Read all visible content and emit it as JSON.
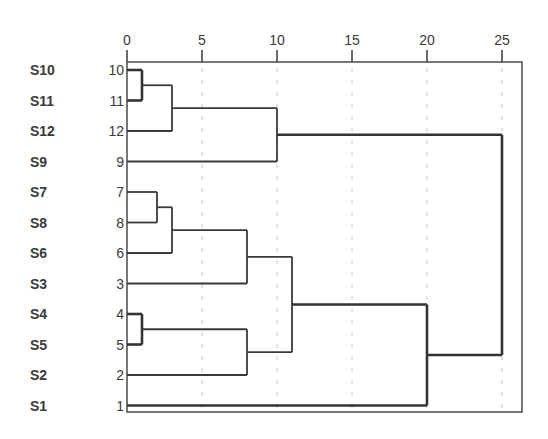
{
  "chart_data": {
    "type": "dendrogram",
    "title": "",
    "xlabel": "",
    "ylabel": "",
    "xlim": [
      0,
      26.3
    ],
    "x_ticks": [
      0,
      5,
      10,
      15,
      20,
      25
    ],
    "x_tick_labels": [
      "0",
      "5",
      "10",
      "15",
      "20",
      "25"
    ],
    "grid": "vertical dashed at ticks",
    "axis_position": "top",
    "leaves": [
      {
        "sample": "S10",
        "index": "10"
      },
      {
        "sample": "S11",
        "index": "11"
      },
      {
        "sample": "S12",
        "index": "12"
      },
      {
        "sample": "S9",
        "index": "9"
      },
      {
        "sample": "S7",
        "index": "7"
      },
      {
        "sample": "S8",
        "index": "8"
      },
      {
        "sample": "S6",
        "index": "6"
      },
      {
        "sample": "S3",
        "index": "3"
      },
      {
        "sample": "S4",
        "index": "4"
      },
      {
        "sample": "S5",
        "index": "5"
      },
      {
        "sample": "S2",
        "index": "2"
      },
      {
        "sample": "S1",
        "index": "1"
      }
    ],
    "merges": [
      {
        "id": "A",
        "children": [
          "10",
          "11"
        ],
        "distance": 1
      },
      {
        "id": "B",
        "children": [
          "A",
          "12"
        ],
        "distance": 3
      },
      {
        "id": "C",
        "children": [
          "B",
          "9"
        ],
        "distance": 10
      },
      {
        "id": "D",
        "children": [
          "7",
          "8"
        ],
        "distance": 2
      },
      {
        "id": "E",
        "children": [
          "D",
          "6"
        ],
        "distance": 3
      },
      {
        "id": "F",
        "children": [
          "E",
          "3"
        ],
        "distance": 8
      },
      {
        "id": "G",
        "children": [
          "4",
          "5"
        ],
        "distance": 1
      },
      {
        "id": "H",
        "children": [
          "G",
          "2"
        ],
        "distance": 8
      },
      {
        "id": "I",
        "children": [
          "F",
          "H"
        ],
        "distance": 11
      },
      {
        "id": "J",
        "children": [
          "I",
          "1"
        ],
        "distance": 20
      },
      {
        "id": "K",
        "children": [
          "C",
          "J"
        ],
        "distance": 25
      }
    ]
  },
  "layout": {
    "plot_left": 127,
    "plot_right": 522,
    "plot_top": 62,
    "plot_bottom": 412,
    "px_per_unit": 15,
    "first_row_y": 70,
    "row_spacing": 30.5
  }
}
